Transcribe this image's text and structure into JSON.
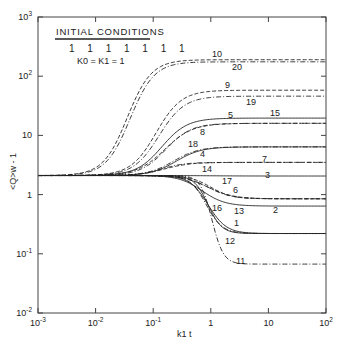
{
  "chart_data": {
    "type": "line",
    "title": "",
    "xlabel": "k1 t",
    "ylabel": "<Q>w - 1",
    "xscale": "log",
    "yscale": "log",
    "xlim": [
      0.001,
      100
    ],
    "ylim": [
      0.01,
      1000
    ],
    "grid": false,
    "x_ticks": [
      {
        "value": 0.001,
        "base": "10",
        "exp": "-3"
      },
      {
        "value": 0.01,
        "base": "10",
        "exp": "-2"
      },
      {
        "value": 0.1,
        "base": "10",
        "exp": "-1"
      },
      {
        "value": 1,
        "base": "1",
        "exp": ""
      },
      {
        "value": 10,
        "base": "10",
        "exp": ""
      },
      {
        "value": 100,
        "base": "10",
        "exp": "2"
      }
    ],
    "y_ticks": [
      {
        "value": 1000,
        "base": "10",
        "exp": "3"
      },
      {
        "value": 100,
        "base": "10",
        "exp": "2"
      },
      {
        "value": 10,
        "base": "10",
        "exp": ""
      },
      {
        "value": 1,
        "base": "1",
        "exp": ""
      },
      {
        "value": 0.1,
        "base": "10",
        "exp": "-1"
      },
      {
        "value": 0.01,
        "base": "10",
        "exp": "-2"
      }
    ],
    "legend": {
      "title": "INITIAL CONDITIONS",
      "marks": "1 1 1 1 1 1 1",
      "constants": "K0 = K1 = 1",
      "position": "upper-left"
    },
    "initial_value": 2.1,
    "series": [
      {
        "name": "1",
        "style": "solid",
        "final": 0.22,
        "center": -0.05,
        "width": 0.16
      },
      {
        "name": "2",
        "style": "solid",
        "final": 0.64,
        "center": -0.15,
        "width": 0.2
      },
      {
        "name": "3",
        "style": "solid",
        "final": 2.06,
        "center": 0.0,
        "width": 0.3
      },
      {
        "name": "4",
        "style": "solid",
        "final": 6.4,
        "center": -0.6,
        "width": 0.22
      },
      {
        "name": "5",
        "style": "solid",
        "final": 19.6,
        "center": -0.85,
        "width": 0.22
      },
      {
        "name": "6",
        "style": "dashed",
        "final": 0.85,
        "center": 0.0,
        "width": 0.18
      },
      {
        "name": "7",
        "style": "dashed",
        "final": 3.5,
        "center": -0.8,
        "width": 0.22
      },
      {
        "name": "8",
        "style": "dashed",
        "final": 16,
        "center": -0.8,
        "width": 0.24
      },
      {
        "name": "9",
        "style": "dashed",
        "final": 58,
        "center": -0.95,
        "width": 0.22
      },
      {
        "name": "10",
        "style": "dashed",
        "final": 190,
        "center": -1.45,
        "width": 0.21
      },
      {
        "name": "11",
        "style": "dashdot",
        "final": 0.067,
        "center": 0.02,
        "width": 0.1
      },
      {
        "name": "12",
        "style": "solid",
        "final": 0.22,
        "center": -0.05,
        "width": 0.12
      },
      {
        "name": "13",
        "style": "dashdot",
        "final": 0.85,
        "center": -0.05,
        "width": 0.2
      },
      {
        "name": "14",
        "style": "dashdot",
        "final": 3.5,
        "center": -0.85,
        "width": 0.2
      },
      {
        "name": "15",
        "style": "dashdot",
        "final": 16,
        "center": -0.78,
        "width": 0.22
      },
      {
        "name": "16",
        "style": "dashdot",
        "final": 0.22,
        "center": -0.08,
        "width": 0.14
      },
      {
        "name": "17",
        "style": "dashed",
        "final": 0.85,
        "center": -0.05,
        "width": 0.22
      },
      {
        "name": "18",
        "style": "dashdot",
        "final": 6.4,
        "center": -0.65,
        "width": 0.22
      },
      {
        "name": "19",
        "style": "dashdot",
        "final": 46,
        "center": -0.9,
        "width": 0.22
      },
      {
        "name": "20",
        "style": "dashdot",
        "final": 175,
        "center": -1.4,
        "width": 0.21
      }
    ],
    "annotations": [
      {
        "text": "10",
        "x": 212,
        "y": 57
      },
      {
        "text": "20",
        "x": 232,
        "y": 70
      },
      {
        "text": "9",
        "x": 225,
        "y": 88
      },
      {
        "text": "19",
        "x": 246,
        "y": 105
      },
      {
        "text": "5",
        "x": 228,
        "y": 118
      },
      {
        "text": "15",
        "x": 270,
        "y": 116
      },
      {
        "text": "8",
        "x": 200,
        "y": 135
      },
      {
        "text": "18",
        "x": 188,
        "y": 147
      },
      {
        "text": "4",
        "x": 200,
        "y": 157
      },
      {
        "text": "7",
        "x": 262,
        "y": 162
      },
      {
        "text": "14",
        "x": 202,
        "y": 172
      },
      {
        "text": "3",
        "x": 265,
        "y": 178
      },
      {
        "text": "17",
        "x": 222,
        "y": 184
      },
      {
        "text": "6",
        "x": 233,
        "y": 193
      },
      {
        "text": "16",
        "x": 212,
        "y": 211
      },
      {
        "text": "13",
        "x": 234,
        "y": 214
      },
      {
        "text": "2",
        "x": 273,
        "y": 213
      },
      {
        "text": "1",
        "x": 234,
        "y": 226
      },
      {
        "text": "12",
        "x": 225,
        "y": 244
      },
      {
        "text": "11",
        "x": 236,
        "y": 264
      }
    ]
  }
}
